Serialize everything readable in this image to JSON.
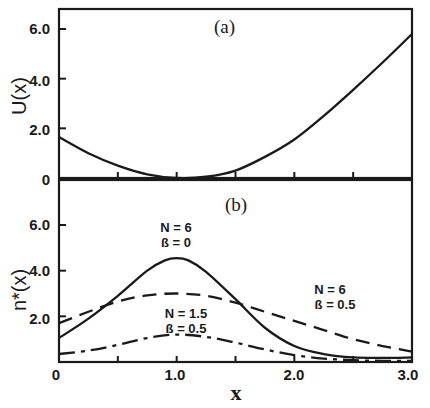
{
  "chart_data": [
    {
      "type": "line",
      "panel_label": "(a)",
      "ylabel": "U(x)",
      "xlabel": "",
      "xlim": [
        0,
        3.0
      ],
      "ylim": [
        0,
        6.8
      ],
      "yticks": [
        0,
        2.0,
        4.0,
        6.0
      ],
      "ytick_labels": [
        "0",
        "2.0",
        "4.0",
        "6.0"
      ],
      "xticks": [
        0.5,
        1.0,
        1.5,
        2.0,
        2.5
      ],
      "grid": false,
      "series": [
        {
          "name": "U(x)",
          "style": "solid",
          "x": [
            0,
            0.25,
            0.5,
            0.75,
            1.0,
            1.25,
            1.5,
            1.75,
            2.0,
            2.25,
            2.5,
            2.75,
            3.0
          ],
          "y": [
            1.65,
            1.0,
            0.5,
            0.15,
            0.0,
            0.05,
            0.3,
            0.85,
            1.55,
            2.5,
            3.55,
            4.65,
            5.8
          ]
        }
      ]
    },
    {
      "type": "line",
      "panel_label": "(b)",
      "ylabel": "n*(x)",
      "xlabel": "x",
      "xlim": [
        0,
        3.0
      ],
      "ylim": [
        0,
        6.8
      ],
      "yticks": [
        0,
        2.0,
        4.0,
        6.0
      ],
      "ytick_labels": [
        "0",
        "2.0",
        "4.0",
        "6.0"
      ],
      "xticks": [
        0,
        0.5,
        1.0,
        1.5,
        2.0,
        2.5,
        3.0
      ],
      "xtick_labels": [
        "0",
        "1.0",
        "2.0",
        "3.0"
      ],
      "xtick_label_values": [
        0,
        1.0,
        2.0,
        3.0
      ],
      "grid": false,
      "series": [
        {
          "name": "N=6, β=0",
          "style": "solid",
          "x": [
            0,
            0.25,
            0.5,
            0.75,
            0.9,
            1.0,
            1.1,
            1.25,
            1.5,
            1.75,
            2.0,
            2.25,
            2.5,
            2.75,
            3.0
          ],
          "y": [
            1.05,
            1.9,
            2.9,
            4.0,
            4.45,
            4.55,
            4.45,
            3.95,
            2.75,
            1.5,
            0.7,
            0.35,
            0.2,
            0.18,
            0.2
          ]
        },
        {
          "name": "N=6, β=0.5",
          "style": "dashed",
          "x": [
            0,
            0.25,
            0.5,
            0.75,
            1.0,
            1.25,
            1.5,
            1.75,
            2.0,
            2.25,
            2.5,
            2.75,
            3.0
          ],
          "y": [
            1.7,
            2.2,
            2.65,
            2.92,
            3.0,
            2.9,
            2.6,
            2.2,
            1.8,
            1.4,
            1.0,
            0.7,
            0.45
          ]
        },
        {
          "name": "N=1.5, β=0.5",
          "style": "dashdot",
          "x": [
            0,
            0.25,
            0.5,
            0.75,
            1.0,
            1.25,
            1.5,
            1.75,
            2.0,
            2.25,
            2.5,
            2.75,
            3.0
          ],
          "y": [
            0.35,
            0.5,
            0.75,
            1.05,
            1.2,
            1.1,
            0.85,
            0.55,
            0.3,
            0.15,
            0.08,
            0.05,
            0.05
          ]
        }
      ],
      "annotations": [
        {
          "line1": "N = 6",
          "line2": "ß = 0"
        },
        {
          "line1": "N = 6",
          "line2": "ß = 0.5"
        },
        {
          "line1": "N = 1.5",
          "line2": "ß = 0.5"
        }
      ]
    }
  ]
}
